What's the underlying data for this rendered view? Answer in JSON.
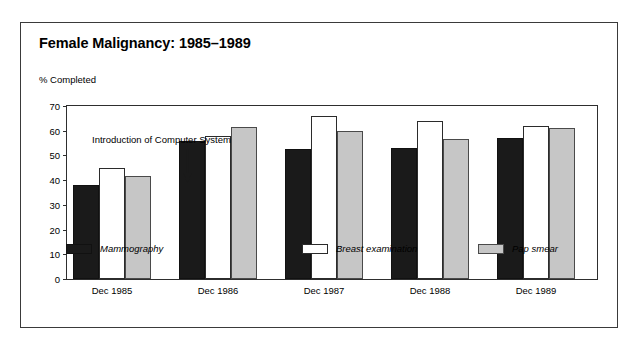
{
  "chart_data": {
    "type": "bar",
    "title": "Female Malignancy: 1985–1989",
    "ylabel": "% Completed",
    "xlabel": "",
    "ylim": [
      0,
      70
    ],
    "yticks": [
      0,
      10,
      20,
      30,
      40,
      50,
      60,
      70
    ],
    "grid": false,
    "legend_position": "bottom",
    "categories": [
      "Dec 1985",
      "Dec 1986",
      "Dec 1987",
      "Dec 1988",
      "Dec 1989"
    ],
    "series": [
      {
        "name": "Mammography",
        "color": "#1a1a1a",
        "values": [
          38,
          56,
          52.5,
          53,
          57
        ]
      },
      {
        "name": "Breast examination",
        "color": "#ffffff",
        "values": [
          45,
          58,
          66,
          64,
          62
        ]
      },
      {
        "name": "Pap smear",
        "color": "#c6c6c6",
        "values": [
          41.5,
          61.5,
          60,
          56.5,
          61
        ]
      }
    ],
    "annotations": [
      {
        "text": "Introduction of Computer System",
        "marker": "down-arrow"
      }
    ]
  },
  "annotation": {
    "text": "Introduction of Computer System"
  },
  "legend": {
    "items": [
      {
        "label": "Mammography"
      },
      {
        "label": "Breast examination"
      },
      {
        "label": "Pap smear"
      }
    ]
  }
}
